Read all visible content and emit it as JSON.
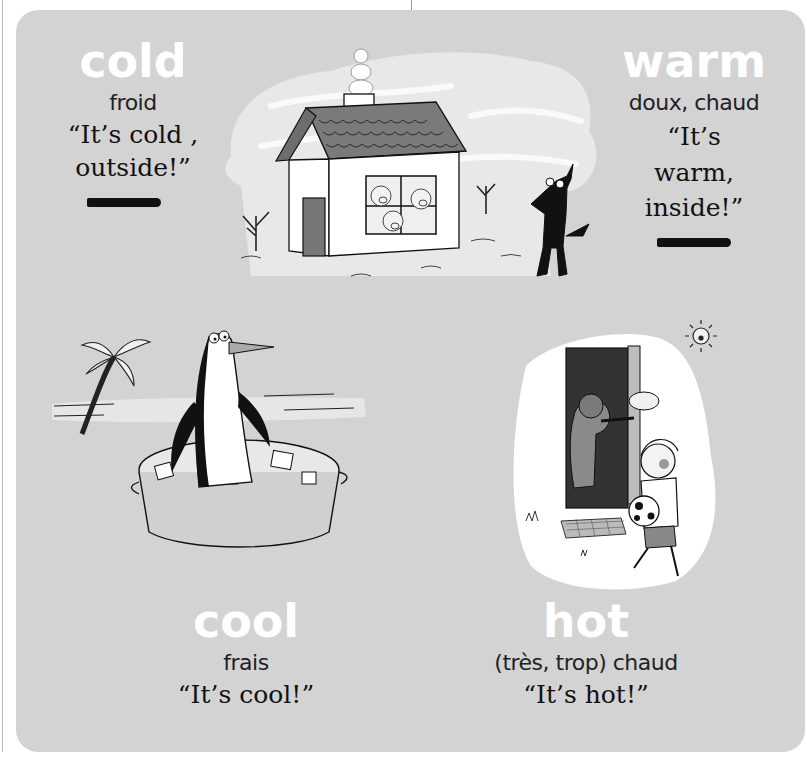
{
  "page": {
    "background_color": "#ffffff",
    "panel_color": "#d3d3d3"
  },
  "cards": {
    "cold": {
      "word": "cold",
      "french": "froid",
      "quote_line1": "“It’s cold ,",
      "quote_line2": "outside!”",
      "illustration": "house-with-pigs-and-shivering-wolf"
    },
    "warm": {
      "word": "warm",
      "french": "doux, chaud",
      "quote_line1": "“It’s",
      "quote_line2": "warm,",
      "quote_line3": "inside!”"
    },
    "cool": {
      "word": "cool",
      "french": "frais",
      "quote": "“It’s cool!”",
      "illustration": "penguin-in-ice-bath-with-palm-tree"
    },
    "hot": {
      "word": "hot",
      "french": "(très, trop) chaud",
      "quote": "“It’s hot!”",
      "illustration": "boy-with-soccer-ball-at-door-with-sun"
    }
  }
}
